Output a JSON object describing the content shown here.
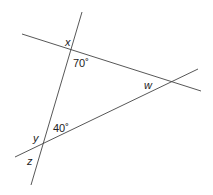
{
  "diagram": {
    "type": "geometry-angles",
    "lines": [
      {
        "name": "steep-line",
        "x1": 82,
        "y1": 12,
        "x2": 31,
        "y2": 185
      },
      {
        "name": "upper-line",
        "x1": 22,
        "y1": 34,
        "x2": 201,
        "y2": 91
      },
      {
        "name": "lower-line",
        "x1": 15,
        "y1": 157,
        "x2": 198,
        "y2": 69
      }
    ],
    "labels": {
      "x": "x",
      "y": "y",
      "z": "z",
      "w": "w",
      "angle_top": "70˚",
      "angle_bottom": "40˚"
    },
    "stroke_color": "#444444"
  }
}
